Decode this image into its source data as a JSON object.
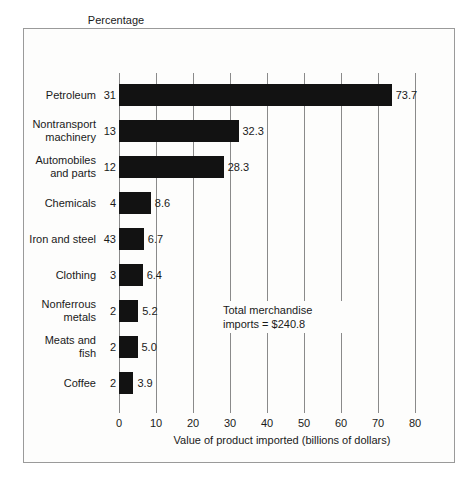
{
  "header": {
    "caption_line1": "Percentage",
    "caption_line2": "of imports"
  },
  "annotation": {
    "line1": "Total merchandise",
    "line2": "imports  =  $240.8"
  },
  "chart_data": {
    "type": "bar",
    "orientation": "horizontal",
    "title": "",
    "xlabel": "Value of product imported (billions of dollars)",
    "ylabel": "",
    "xlim": [
      0,
      80
    ],
    "xticks": [
      0,
      10,
      20,
      30,
      40,
      50,
      60,
      70,
      80
    ],
    "xtick_labels": [
      "0",
      "10",
      "20",
      "30",
      "40",
      "50",
      "60",
      "70",
      "80"
    ],
    "grid": "vertical",
    "legend": "none",
    "percent_column_header": "Percentage of imports",
    "categories": [
      "Petroleum",
      "Nontransport machinery",
      "Automobiles and parts",
      "Chemicals",
      "Iron and steel",
      "Clothing",
      "Nonferrous metals",
      "Meats and fish",
      "Coffee"
    ],
    "category_lines": [
      [
        "Petroleum"
      ],
      [
        "Nontransport",
        "machinery"
      ],
      [
        "Automobiles",
        "and parts"
      ],
      [
        "Chemicals"
      ],
      [
        "Iron and steel"
      ],
      [
        "Clothing"
      ],
      [
        "Nonferrous",
        "metals"
      ],
      [
        "Meats and",
        "fish"
      ],
      [
        "Coffee"
      ]
    ],
    "percentages": [
      "31",
      "13",
      "12",
      "4",
      "43",
      "3",
      "2",
      "2",
      "2"
    ],
    "values": [
      73.7,
      32.3,
      28.3,
      8.6,
      6.7,
      6.4,
      5.2,
      5.0,
      3.9
    ],
    "value_labels": [
      "73.7",
      "32.3",
      "28.3",
      "8.6",
      "6.7",
      "6.4",
      "5.2",
      "5.0",
      "3.9"
    ],
    "annotation_text": "Total merchandise imports  =  $240.8",
    "bar_color": "#121212",
    "grid_color": "#8a8a8a",
    "background_color": "#fdfdfc"
  }
}
